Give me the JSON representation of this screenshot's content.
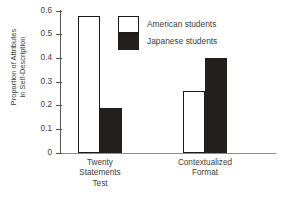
{
  "chart_data": {
    "type": "bar",
    "title": "",
    "xlabel": "",
    "ylabel_lines": [
      "Proportion of Attributes",
      "in Self-Description"
    ],
    "ylabel": "Proportion of Attributes in Self-Description",
    "ylim": [
      0,
      0.6
    ],
    "yticks": [
      0,
      0.1,
      0.2,
      0.3,
      0.4,
      0.5,
      0.6
    ],
    "ytick_labels": [
      "0",
      "0.1",
      "0.2",
      "0.3",
      "0.4",
      "0.5",
      "0.6"
    ],
    "grid": false,
    "legend_position": "upper center",
    "categories": [
      "Twenty Statements Test",
      "Contextualized Format"
    ],
    "category_label_lines": [
      [
        "Twenty",
        "Statements",
        "Test"
      ],
      [
        "Contextualized",
        "Format"
      ]
    ],
    "series": [
      {
        "name": "American students",
        "fill": "#ffffff",
        "edge": "#1a1a1a",
        "values": [
          0.58,
          0.26
        ]
      },
      {
        "name": "Japanese students",
        "fill": "#231f1c",
        "edge": "#231f1c",
        "values": [
          0.19,
          0.4
        ]
      }
    ]
  },
  "legend": {
    "items": [
      {
        "label": "American students",
        "swatch": "white"
      },
      {
        "label": "Japanese students",
        "swatch": "black"
      }
    ]
  },
  "axis": {
    "baseline_value": "0",
    "max_value": "0.6"
  }
}
